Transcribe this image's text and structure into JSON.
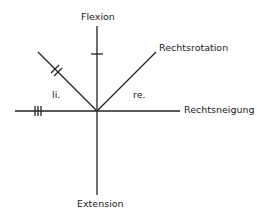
{
  "diagram": {
    "labels": {
      "top": "Flexion",
      "bottom": "Extension",
      "right": "Rechtsneigung",
      "upper_right": "Rechtsrotation",
      "left_side": "li.",
      "right_side": "re."
    },
    "tick_marks": {
      "flexion_axis": 1,
      "left_diagonal": 2,
      "left_horizontal": 3
    },
    "line_color": "#222222"
  }
}
